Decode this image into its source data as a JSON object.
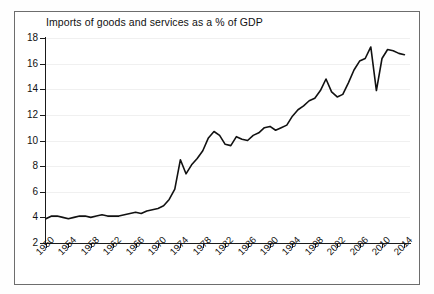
{
  "chart_data": {
    "type": "line",
    "title": "Imports of goods and services as a % of GDP",
    "xlabel": "",
    "ylabel": "",
    "grid": true,
    "legend": false,
    "xlim": [
      1950,
      2015
    ],
    "ylim": [
      2,
      18
    ],
    "ytick_labels": [
      "18",
      "16",
      "14",
      "12",
      "10",
      "8",
      "6",
      "4",
      "2"
    ],
    "ytick_values": [
      18,
      16,
      14,
      12,
      10,
      8,
      6,
      4,
      2
    ],
    "xtick_labels": [
      "1950",
      "1954",
      "1958",
      "1962",
      "1966",
      "1970",
      "1974",
      "1978",
      "1982",
      "1986",
      "1990",
      "1994",
      "1998",
      "2002",
      "2006",
      "2010",
      "2014"
    ],
    "xtick_values": [
      1950,
      1954,
      1958,
      1962,
      1966,
      1970,
      1974,
      1978,
      1982,
      1986,
      1990,
      1994,
      1998,
      2002,
      2006,
      2010,
      2014
    ],
    "series": [
      {
        "name": "Imports of goods and services as a % of GDP",
        "color": "#111111",
        "x": [
          1950,
          1951,
          1952,
          1953,
          1954,
          1955,
          1956,
          1957,
          1958,
          1959,
          1960,
          1961,
          1962,
          1963,
          1964,
          1965,
          1966,
          1967,
          1968,
          1969,
          1970,
          1971,
          1972,
          1973,
          1974,
          1975,
          1976,
          1977,
          1978,
          1979,
          1980,
          1981,
          1982,
          1983,
          1984,
          1985,
          1986,
          1987,
          1988,
          1989,
          1990,
          1991,
          1992,
          1993,
          1994,
          1995,
          1996,
          1997,
          1998,
          1999,
          2000,
          2001,
          2002,
          2003,
          2004,
          2005,
          2006,
          2007,
          2008,
          2009,
          2010,
          2011,
          2012,
          2013,
          2014
        ],
        "y": [
          3.9,
          4.1,
          4.1,
          4.0,
          3.9,
          4.0,
          4.1,
          4.1,
          4.0,
          4.1,
          4.2,
          4.1,
          4.1,
          4.1,
          4.2,
          4.3,
          4.4,
          4.3,
          4.5,
          4.6,
          4.7,
          4.9,
          5.4,
          6.2,
          8.5,
          7.4,
          8.1,
          8.6,
          9.2,
          10.2,
          10.7,
          10.4,
          9.7,
          9.6,
          10.3,
          10.1,
          10.0,
          10.4,
          10.6,
          11.0,
          11.1,
          10.8,
          11.0,
          11.2,
          11.9,
          12.4,
          12.7,
          13.1,
          13.3,
          13.9,
          14.8,
          13.8,
          13.4,
          13.6,
          14.5,
          15.5,
          16.2,
          16.4,
          17.3,
          13.9,
          16.4,
          17.1,
          17.0,
          16.8,
          16.7
        ]
      }
    ]
  },
  "axes": {
    "y_title": "",
    "x_title": ""
  }
}
